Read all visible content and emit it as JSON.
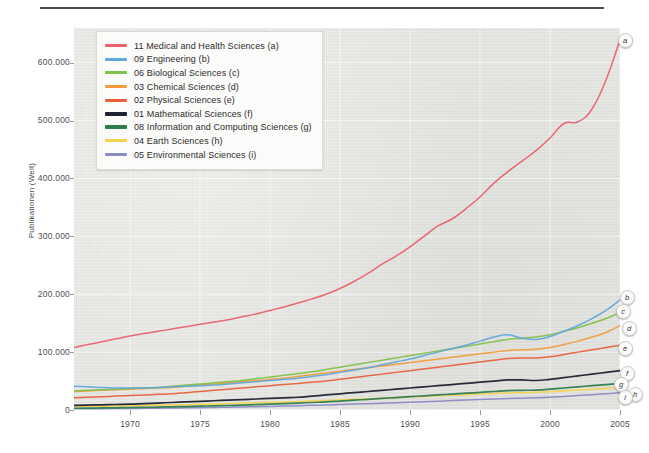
{
  "figure": {
    "ylabel": "Publikationen (Welt)",
    "top_fragment": ""
  },
  "legend": {
    "items": [
      {
        "label": "11 Medical and Health Sciences (a)",
        "color": "#e8616d",
        "key": "a"
      },
      {
        "label": "09 Engineering (b)",
        "color": "#5fa8dc",
        "key": "b"
      },
      {
        "label": "06 Biological Sciences (c)",
        "color": "#7fc24a",
        "key": "c"
      },
      {
        "label": "03 Chemical Sciences (d)",
        "color": "#f29b3c",
        "key": "d"
      },
      {
        "label": "02 Physical Sciences (e)",
        "color": "#e8613c",
        "key": "e"
      },
      {
        "label": "01 Mathematical Sciences (f)",
        "color": "#1d2230",
        "key": "f"
      },
      {
        "label": "08 Information and Computing Sciences (g)",
        "color": "#2e7d4f",
        "key": "g"
      },
      {
        "label": "04 Earth Sciences (h)",
        "color": "#f5d24e",
        "key": "h"
      },
      {
        "label": "05 Environmental Sciences (i)",
        "color": "#8a8ac4",
        "key": "i"
      }
    ]
  },
  "axes": {
    "y_ticks": [
      "0",
      "100.000",
      "200.000",
      "300.000",
      "400.000",
      "500.000",
      "600.000"
    ],
    "y_tick_values": [
      0,
      100000,
      200000,
      300000,
      400000,
      500000,
      600000
    ],
    "x_ticks": [
      "1970",
      "1975",
      "1980",
      "1985",
      "1990",
      "1995",
      "2000",
      "2005"
    ],
    "x_tick_values": [
      1970,
      1975,
      1980,
      1985,
      1990,
      1995,
      2000,
      2005
    ]
  },
  "chart_data": {
    "type": "line",
    "title": "",
    "xlabel": "",
    "ylabel": "Publikationen (Welt)",
    "xlim": [
      1966,
      2005
    ],
    "ylim": [
      0,
      660000
    ],
    "grid": true,
    "legend_position": "top-left",
    "x": [
      1966,
      1967,
      1968,
      1969,
      1970,
      1971,
      1972,
      1973,
      1974,
      1975,
      1976,
      1977,
      1978,
      1979,
      1980,
      1981,
      1982,
      1983,
      1984,
      1985,
      1986,
      1987,
      1988,
      1989,
      1990,
      1991,
      1992,
      1993,
      1994,
      1995,
      1996,
      1997,
      1998,
      1999,
      2000,
      2001,
      2002,
      2003,
      2004,
      2005
    ],
    "series": [
      {
        "name": "11 Medical and Health Sciences (a)",
        "key": "a",
        "color": "#e8616d",
        "values": [
          108000,
          113000,
          118000,
          123000,
          128000,
          132000,
          136000,
          140000,
          144000,
          148000,
          152000,
          156000,
          161000,
          166000,
          172000,
          178000,
          185000,
          192000,
          200000,
          210000,
          222000,
          236000,
          252000,
          266000,
          282000,
          300000,
          318000,
          330000,
          348000,
          368000,
          392000,
          412000,
          430000,
          448000,
          470000,
          495000,
          498000,
          520000,
          570000,
          640000
        ]
      },
      {
        "name": "09 Engineering (b)",
        "key": "b",
        "color": "#5fa8dc",
        "values": [
          41000,
          40000,
          39000,
          38000,
          38000,
          38000,
          39000,
          40000,
          41000,
          42000,
          43000,
          45000,
          47000,
          49000,
          51000,
          53000,
          55000,
          58000,
          61000,
          65000,
          69000,
          73000,
          78000,
          83000,
          88000,
          94000,
          100000,
          106000,
          112000,
          119000,
          126000,
          130000,
          124000,
          122000,
          127000,
          136000,
          146000,
          158000,
          172000,
          190000
        ]
      },
      {
        "name": "06 Biological Sciences (c)",
        "key": "c",
        "color": "#7fc24a",
        "values": [
          33000,
          34000,
          35000,
          36000,
          37000,
          38000,
          39000,
          41000,
          43000,
          45000,
          47000,
          49000,
          51000,
          54000,
          57000,
          60000,
          63000,
          66000,
          70000,
          74000,
          78000,
          82000,
          86000,
          90000,
          94000,
          98000,
          102000,
          106000,
          110000,
          114000,
          118000,
          122000,
          124000,
          126000,
          130000,
          136000,
          142000,
          150000,
          158000,
          168000
        ]
      },
      {
        "name": "03 Chemical Sciences (d)",
        "key": "d",
        "color": "#f29b3c",
        "values": [
          32000,
          33000,
          34000,
          35000,
          36000,
          37000,
          38000,
          39000,
          41000,
          43000,
          45000,
          47000,
          49000,
          51000,
          53000,
          55000,
          58000,
          61000,
          64000,
          67000,
          70000,
          73000,
          76000,
          79000,
          82000,
          85000,
          88000,
          91000,
          94000,
          97000,
          100000,
          103000,
          104000,
          105000,
          108000,
          113000,
          119000,
          126000,
          134000,
          146000
        ]
      },
      {
        "name": "02 Physical Sciences (e)",
        "key": "e",
        "color": "#e8613c",
        "values": [
          21000,
          22000,
          23000,
          24000,
          25000,
          26000,
          27000,
          28000,
          30000,
          32000,
          34000,
          36000,
          38000,
          40000,
          42000,
          44000,
          46000,
          48000,
          50000,
          53000,
          56000,
          59000,
          62000,
          65000,
          68000,
          71000,
          74000,
          77000,
          80000,
          83000,
          86000,
          89000,
          90000,
          90000,
          92000,
          96000,
          100000,
          104000,
          108000,
          112000
        ]
      },
      {
        "name": "01 Mathematical Sciences (f)",
        "key": "f",
        "color": "#1d2230",
        "values": [
          8000,
          8500,
          9000,
          9500,
          10000,
          11000,
          12000,
          13000,
          14000,
          15000,
          16000,
          17000,
          18000,
          19000,
          20000,
          21000,
          22000,
          24000,
          26000,
          28000,
          30000,
          32000,
          34000,
          36000,
          38000,
          40000,
          42000,
          44000,
          46000,
          48000,
          50000,
          52000,
          52000,
          51000,
          53000,
          56000,
          59000,
          62000,
          65000,
          68000
        ]
      },
      {
        "name": "08 Information and Computing Sciences (g)",
        "key": "g",
        "color": "#2e7d4f",
        "values": [
          3000,
          3200,
          3500,
          3800,
          4200,
          4600,
          5000,
          5500,
          6000,
          6600,
          7200,
          7800,
          8500,
          9200,
          10000,
          11000,
          12000,
          13000,
          14000,
          15500,
          17000,
          18500,
          20000,
          21500,
          23000,
          24500,
          26000,
          27500,
          29000,
          30500,
          32000,
          33500,
          34000,
          34500,
          36000,
          38000,
          40000,
          42000,
          44000,
          46000
        ]
      },
      {
        "name": "04 Earth Sciences (h)",
        "key": "h",
        "color": "#f5d24e",
        "values": [
          6000,
          6300,
          6600,
          7000,
          7400,
          7800,
          8200,
          8700,
          9200,
          9800,
          10400,
          11000,
          11700,
          12400,
          13200,
          14000,
          14800,
          15600,
          16500,
          17500,
          18500,
          19500,
          20500,
          21500,
          22500,
          23500,
          24500,
          25500,
          26500,
          27500,
          28500,
          29500,
          30000,
          30500,
          31500,
          33000,
          34500,
          36000,
          37500,
          39000
        ]
      },
      {
        "name": "05 Environmental Sciences (i)",
        "key": "i",
        "color": "#8a8ac4",
        "values": [
          2000,
          2100,
          2300,
          2500,
          2700,
          2900,
          3100,
          3400,
          3700,
          4000,
          4400,
          4800,
          5200,
          5700,
          6200,
          6800,
          7400,
          8000,
          8700,
          9400,
          10200,
          11000,
          11800,
          12600,
          13500,
          14400,
          15300,
          16200,
          17100,
          18000,
          19000,
          20000,
          20500,
          21000,
          22000,
          23500,
          25000,
          26500,
          28000,
          30000
        ]
      }
    ]
  },
  "endpoint_badges": [
    {
      "key": "a"
    },
    {
      "key": "b"
    },
    {
      "key": "c"
    },
    {
      "key": "d"
    },
    {
      "key": "e"
    },
    {
      "key": "f"
    },
    {
      "key": "g"
    },
    {
      "key": "h"
    },
    {
      "key": "i"
    }
  ]
}
